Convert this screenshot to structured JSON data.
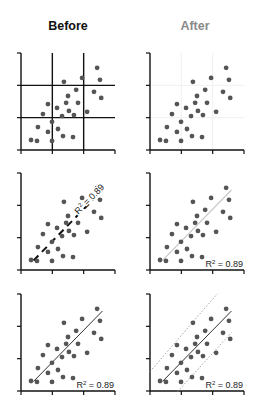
{
  "chart_data": {
    "type": "scatter",
    "column_titles": [
      {
        "label": "Before",
        "color": "#111111"
      },
      {
        "label": "After",
        "color": "#8a8a8a"
      }
    ],
    "xlim": [
      0,
      3
    ],
    "ylim": [
      0,
      3
    ],
    "x_ticks": [
      0,
      1,
      2,
      3
    ],
    "y_ticks": [
      0,
      1,
      2,
      3
    ],
    "tick_labels_shown": false,
    "points": {
      "x": [
        2.43,
        2.52,
        1.95,
        1.37,
        1.76,
        2.33,
        2.56,
        1.5,
        0.86,
        1.44,
        1.82,
        1.15,
        2.11,
        1.53,
        0.7,
        1.31,
        1.69,
        0.99,
        0.54,
        1.18,
        0.86,
        1.34,
        1.66,
        0.32,
        0.51,
        0.99
      ],
      "y": [
        2.54,
        2.17,
        2.23,
        2.11,
        1.86,
        1.8,
        1.61,
        1.67,
        1.42,
        1.46,
        1.46,
        1.3,
        1.18,
        1.21,
        1.11,
        1.05,
        1.08,
        0.87,
        0.71,
        0.65,
        0.56,
        0.43,
        0.4,
        0.31,
        0.28,
        0.28
      ],
      "color": "#555555"
    },
    "fit": {
      "x_range": [
        0.4,
        2.6
      ],
      "slope": 0.99,
      "intercept": -0.1,
      "r2_label": "R",
      "r2_sup": "2",
      "r2_value": " = 0.89"
    },
    "prediction_band": {
      "upper": {
        "slope": 1.12,
        "intercept": 0.6,
        "x_range": [
          0.0,
          2.15
        ]
      },
      "lower": {
        "slope": 1.06,
        "intercept": -0.95,
        "x_range": [
          0.88,
          2.6
        ]
      }
    },
    "panels": [
      {
        "name": "before-gridlines",
        "row": 1,
        "col": 1,
        "grid": "heavy",
        "fit_line": "none",
        "band": false,
        "r2": "none"
      },
      {
        "name": "after-gridlines",
        "row": 1,
        "col": 2,
        "grid": "faint",
        "fit_line": "none",
        "band": false,
        "r2": "none"
      },
      {
        "name": "before-fit",
        "row": 2,
        "col": 1,
        "grid": "none",
        "fit_line": "heavy-dashed",
        "band": false,
        "r2": "rotated-on-line"
      },
      {
        "name": "after-fit",
        "row": 2,
        "col": 2,
        "grid": "none",
        "fit_line": "light-solid",
        "band": false,
        "r2": "bottom-right"
      },
      {
        "name": "before-band",
        "row": 3,
        "col": 1,
        "grid": "none",
        "fit_line": "dark-solid",
        "band": false,
        "r2": "bottom-right"
      },
      {
        "name": "after-band",
        "row": 3,
        "col": 2,
        "grid": "none",
        "fit_line": "dark-solid",
        "band": true,
        "r2": "bottom-right"
      }
    ]
  }
}
